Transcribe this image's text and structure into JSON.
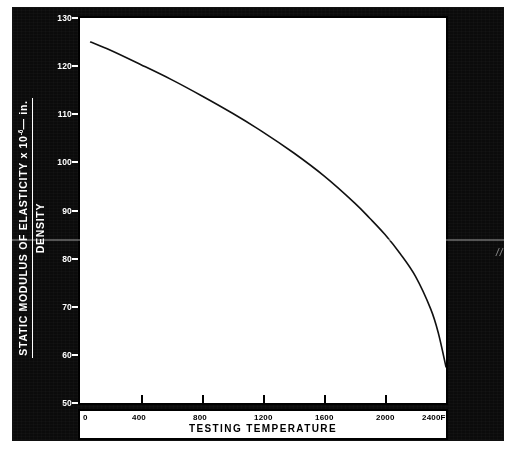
{
  "figure": {
    "background_color": "#0b0b0b",
    "panel_color": "#ffffff",
    "corner_mark": "//"
  },
  "chart_data": {
    "type": "line",
    "title": "",
    "subtitle": "",
    "xlabel": "TESTING TEMPERATURE",
    "ylabel_numerator": "STATIC MODULUS OF ELASTICITY x 10",
    "ylabel_numerator_exponent": "-6",
    "ylabel_numerator_tail": "— in.",
    "ylabel_denominator": "DENSITY",
    "xlim": [
      0,
      2400
    ],
    "ylim": [
      50,
      130
    ],
    "grid": false,
    "legend": null,
    "x_ticks": [
      {
        "value": 0,
        "label": "0"
      },
      {
        "value": 400,
        "label": "400"
      },
      {
        "value": 800,
        "label": "800"
      },
      {
        "value": 1200,
        "label": "1200"
      },
      {
        "value": 1600,
        "label": "1600"
      },
      {
        "value": 2000,
        "label": "2000"
      },
      {
        "value": 2400,
        "label": "2400F"
      }
    ],
    "y_ticks": [
      {
        "value": 130,
        "label": "130"
      },
      {
        "value": 120,
        "label": "120"
      },
      {
        "value": 110,
        "label": "110"
      },
      {
        "value": 100,
        "label": "100"
      },
      {
        "value": 90,
        "label": "90"
      },
      {
        "value": 80,
        "label": "80"
      },
      {
        "value": 70,
        "label": "70"
      },
      {
        "value": 60,
        "label": "60"
      },
      {
        "value": 50,
        "label": "50"
      }
    ],
    "series": [
      {
        "name": "Static modulus of elasticity / density",
        "color": "#111111",
        "x": [
          70,
          200,
          400,
          600,
          800,
          1000,
          1200,
          1400,
          1600,
          1800,
          1900,
          2000,
          2100,
          2200,
          2300,
          2350,
          2400
        ],
        "y": [
          125.0,
          123.3,
          120.3,
          117.2,
          113.8,
          110.2,
          106.3,
          102.0,
          97.2,
          91.6,
          88.4,
          85.0,
          81.0,
          76.3,
          69.5,
          64.5,
          57.5
        ]
      }
    ]
  }
}
